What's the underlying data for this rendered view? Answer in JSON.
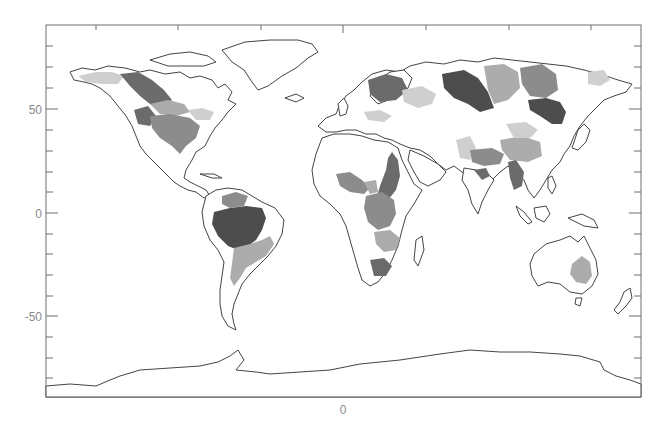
{
  "map": {
    "projection": "equirectangular",
    "lon_range": [
      -180,
      180
    ],
    "lat_range": [
      -90,
      90
    ],
    "y_tick_labels": [
      "50",
      "0",
      "-50"
    ],
    "y_tick_values": [
      50,
      0,
      -50
    ],
    "x_tick_labels": [
      "0"
    ],
    "x_tick_values": [
      0
    ],
    "colors": {
      "frame": "#6e6e6e",
      "coastline": "#444444",
      "label": "#8a8a8a",
      "shade_darkest": "#4d4d4d",
      "shade_dark": "#6b6b6b",
      "shade_mid": "#8c8c8c",
      "shade_light": "#acacac",
      "shade_lightest": "#cfcfcf"
    },
    "shaded_basins": [
      {
        "name": "Amazon",
        "shade": "darkest"
      },
      {
        "name": "Orinoco",
        "shade": "mid"
      },
      {
        "name": "Parana / La Plata",
        "shade": "light"
      },
      {
        "name": "Sao Francisco",
        "shade": "light"
      },
      {
        "name": "Mackenzie",
        "shade": "dark"
      },
      {
        "name": "Yukon",
        "shade": "lightest"
      },
      {
        "name": "Mississippi",
        "shade": "mid"
      },
      {
        "name": "Columbia",
        "shade": "dark"
      },
      {
        "name": "Nelson / Saskatchewan",
        "shade": "light"
      },
      {
        "name": "St. Lawrence",
        "shade": "lightest"
      },
      {
        "name": "Nile",
        "shade": "dark"
      },
      {
        "name": "Niger",
        "shade": "mid"
      },
      {
        "name": "Lake Chad",
        "shade": "light"
      },
      {
        "name": "Congo",
        "shade": "mid"
      },
      {
        "name": "Zambezi",
        "shade": "light"
      },
      {
        "name": "Orange",
        "shade": "dark"
      },
      {
        "name": "Volga",
        "shade": "lightest"
      },
      {
        "name": "Baltic / Northern Europe",
        "shade": "dark"
      },
      {
        "name": "Danube",
        "shade": "lightest"
      },
      {
        "name": "Ob",
        "shade": "darkest"
      },
      {
        "name": "Yenisei",
        "shade": "light"
      },
      {
        "name": "Lena",
        "shade": "mid"
      },
      {
        "name": "Amur",
        "shade": "darkest"
      },
      {
        "name": "Kolyma",
        "shade": "lightest"
      },
      {
        "name": "Indus",
        "shade": "lightest"
      },
      {
        "name": "Ganges-Brahmaputra",
        "shade": "mid"
      },
      {
        "name": "Godavari",
        "shade": "dark"
      },
      {
        "name": "Yangtze",
        "shade": "light"
      },
      {
        "name": "Yellow River",
        "shade": "lightest"
      },
      {
        "name": "Mekong",
        "shade": "dark"
      },
      {
        "name": "Murray-Darling",
        "shade": "light"
      }
    ]
  }
}
